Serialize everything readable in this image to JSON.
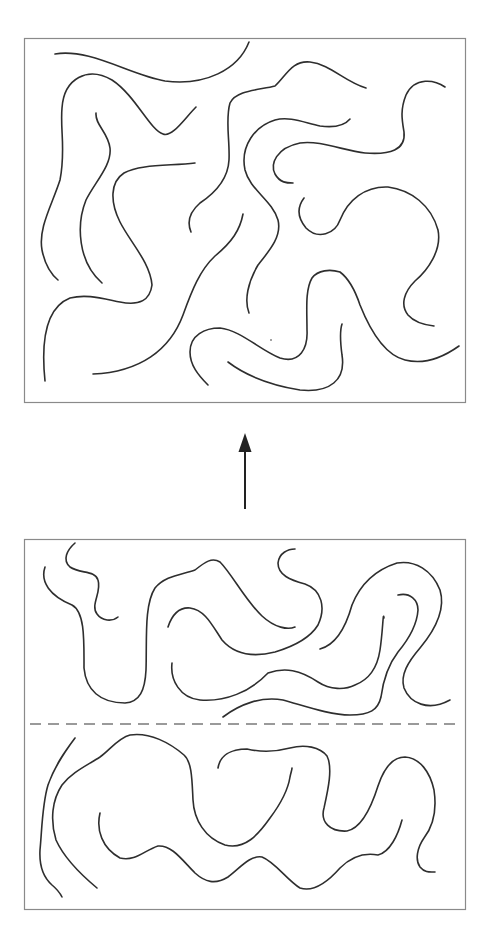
{
  "figure": {
    "top_panel": {
      "label": "interdiffused-state",
      "chain_count": 11
    },
    "arrow": {
      "direction": "up",
      "meaning": "transition from bottom state to top state"
    },
    "bottom_panel": {
      "label": "initial-interface-state",
      "interface_line": "dashed",
      "upper_layer_chain_count": 5,
      "lower_layer_chain_count": 4
    },
    "colors": {
      "chain": "#2e2e2e",
      "frame": "#8a8a8a",
      "interface": "#7a7a7a",
      "background": "#ffffff"
    }
  }
}
